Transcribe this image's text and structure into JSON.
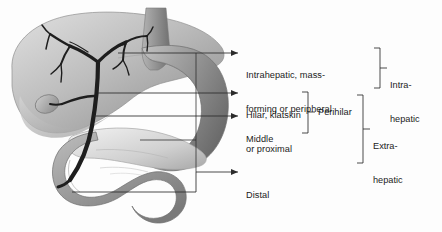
{
  "figure": {
    "background_color": "#fdfdfd",
    "line_color": "#2b2b2b",
    "text_color": "#1b1b1b"
  },
  "anatomy": {
    "parts": [
      {
        "name": "liver",
        "label": "Liver",
        "fill_light": "#d9d9d9",
        "fill_dark": "#8c8c8c"
      },
      {
        "name": "gallbladder",
        "label": "Gallbladder",
        "fill_light": "#c9c9c9",
        "fill_dark": "#8f8f8f"
      },
      {
        "name": "biliary-tree",
        "label": "Biliary tree",
        "fill_light": "#4a4a4a",
        "fill_dark": "#1f1f1f"
      },
      {
        "name": "stomach",
        "label": "Stomach",
        "fill_light": "#b5b5b5",
        "fill_dark": "#6f6f6f"
      },
      {
        "name": "pancreas",
        "label": "Pancreas",
        "fill_light": "#9a9a9a",
        "fill_dark": "#6a6a6a"
      },
      {
        "name": "duodenum",
        "label": "Duodenum",
        "fill_light": "#a8a8a8",
        "fill_dark": "#6e6e6e"
      }
    ]
  },
  "callouts": [
    {
      "id": "intrahepatic",
      "text_line1": "Intrahepatic, mass-",
      "text_line2": "forming or peripheral"
    },
    {
      "id": "hilar",
      "text_line1": "Hilar, klatskin",
      "text_line2": "or proximal"
    },
    {
      "id": "middle",
      "text_line1": "Middle",
      "text_line2": ""
    },
    {
      "id": "distal",
      "text_line1": "Distal",
      "text_line2": ""
    }
  ],
  "groups": [
    {
      "id": "perihilar",
      "label": "Perihilar"
    },
    {
      "id": "intra-hepatic",
      "label_line1": "Intra-",
      "label_line2": "hepatic"
    },
    {
      "id": "extra-hepatic",
      "label_line1": "Extra-",
      "label_line2": "hepatic"
    }
  ]
}
